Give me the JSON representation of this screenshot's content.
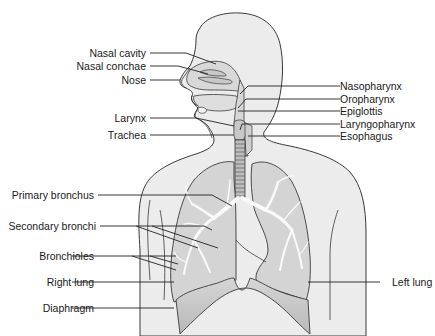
{
  "diagram": {
    "colors": {
      "body_fill": "#ececec",
      "lung_fill": "#d2d2d2",
      "lung_lower_fill": "#c4c4c4",
      "airway_fill": "#f6f6f6",
      "outline": "#3a3a3a",
      "leader_line": "#222222",
      "text": "#1a1a1a"
    },
    "labels_left": [
      {
        "id": "nasal-cavity",
        "text": "Nasal cavity"
      },
      {
        "id": "nasal-conchae",
        "text": "Nasal conchae"
      },
      {
        "id": "nose",
        "text": "Nose"
      },
      {
        "id": "larynx",
        "text": "Larynx"
      },
      {
        "id": "trachea",
        "text": "Trachea"
      },
      {
        "id": "primary-bronchus",
        "text": "Primary bronchus"
      },
      {
        "id": "secondary-bronchi",
        "text": "Secondary bronchi"
      },
      {
        "id": "bronchioles",
        "text": "Bronchioles"
      },
      {
        "id": "right-lung",
        "text": "Right lung"
      },
      {
        "id": "diaphragm",
        "text": "Diaphragm"
      }
    ],
    "labels_right": [
      {
        "id": "nasopharynx",
        "text": "Nasopharynx"
      },
      {
        "id": "oropharynx",
        "text": "Oropharynx"
      },
      {
        "id": "epiglottis",
        "text": "Epiglottis"
      },
      {
        "id": "laryngopharynx",
        "text": "Laryngopharynx"
      },
      {
        "id": "esophagus",
        "text": "Esophagus"
      },
      {
        "id": "left-lung",
        "text": "Left lung"
      }
    ]
  }
}
